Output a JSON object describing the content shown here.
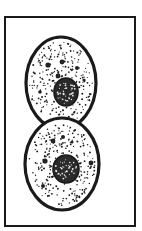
{
  "figure": {
    "description": "Two adjoining rounded cells with stippled cytoplasm and dark nuclei, enclosed in a rectangular frame",
    "colors": {
      "ink": "#1a1a1a",
      "background": "#ffffff",
      "granule": "#222222"
    },
    "frame": {
      "x": 5,
      "y": 17,
      "width": 130,
      "height": 209,
      "stroke_width": 2
    },
    "cells": [
      {
        "name": "top-cell",
        "cx": 61,
        "cy": 83,
        "rx": 35,
        "ry": 46,
        "stroke_width": 3.2,
        "nucleus": {
          "cx": 66,
          "cy": 92,
          "rx": 12,
          "ry": 14
        },
        "granules": [
          [
            48,
            65,
            2.6
          ],
          [
            62,
            62,
            2.4
          ],
          [
            58,
            76,
            2.4
          ],
          [
            77,
            68,
            2
          ],
          [
            40,
            92,
            1.8
          ],
          [
            84,
            80,
            1.6
          ]
        ],
        "seed": 7
      },
      {
        "name": "bottom-cell",
        "cx": 62,
        "cy": 164,
        "rx": 37,
        "ry": 46,
        "stroke_width": 3.2,
        "nucleus": {
          "cx": 66,
          "cy": 169,
          "rx": 13,
          "ry": 14
        },
        "granules": [
          [
            53,
            141,
            2.4
          ],
          [
            63,
            137,
            2
          ],
          [
            45,
            161,
            2.6
          ],
          [
            91,
            163,
            2.4
          ],
          [
            43,
            186,
            2
          ],
          [
            72,
            142,
            1.6
          ]
        ],
        "seed": 19
      }
    ]
  }
}
